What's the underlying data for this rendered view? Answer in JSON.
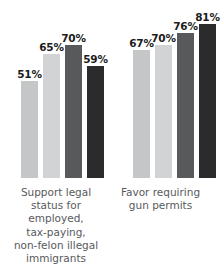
{
  "chart_data": {
    "type": "bar",
    "title": "",
    "subtitle": "",
    "xlabel": "",
    "ylabel": "",
    "ylim": [
      0,
      100
    ],
    "grid": false,
    "legend_position": "none",
    "value_suffix": "%",
    "categories": [
      "Support legal status for employed, tax-paying, non-felon illegal immigrants",
      "Favor requiring gun permits"
    ],
    "groups": [
      {
        "category": "Support legal status for employed, tax-paying, non-felon illegal immigrants",
        "caption_lines": [
          "Support legal",
          "status for employed,",
          "tax-paying,",
          "non-felon illegal",
          "immigrants"
        ],
        "bars": [
          {
            "value": 51,
            "label": "51%",
            "color": "#c5c6c8"
          },
          {
            "value": 65,
            "label": "65%",
            "color": "#d2d3d5"
          },
          {
            "value": 70,
            "label": "70%",
            "color": "#58595b"
          },
          {
            "value": 59,
            "label": "59%",
            "color": "#2b2b2d"
          }
        ]
      },
      {
        "category": "Favor requiring gun permits",
        "caption_lines": [
          "Favor requiring",
          "gun permits"
        ],
        "bars": [
          {
            "value": 67,
            "label": "67%",
            "color": "#c5c6c8"
          },
          {
            "value": 70,
            "label": "70%",
            "color": "#d2d3d5"
          },
          {
            "value": 76,
            "label": "76%",
            "color": "#58595b"
          },
          {
            "value": 81,
            "label": "81%",
            "color": "#2b2b2d"
          }
        ]
      }
    ],
    "series": [
      {
        "name": "series-1",
        "values": [
          51,
          67
        ],
        "color": "#c5c6c8"
      },
      {
        "name": "series-2",
        "values": [
          65,
          70
        ],
        "color": "#d2d3d5"
      },
      {
        "name": "series-3",
        "values": [
          70,
          76
        ],
        "color": "#58595b"
      },
      {
        "name": "series-4",
        "values": [
          59,
          81
        ],
        "color": "#2b2b2d"
      }
    ],
    "colors": {
      "bar_1": "#c5c6c8",
      "bar_2": "#d2d3d5",
      "bar_3": "#58595b",
      "bar_4": "#2b2b2d",
      "label_text": "#1c1c1c",
      "caption_text": "#58595b",
      "background": "#ffffff"
    }
  }
}
